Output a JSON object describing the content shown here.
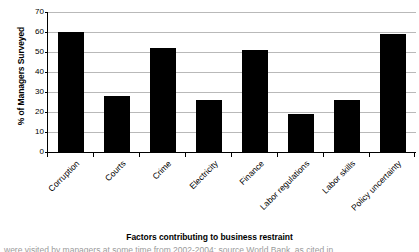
{
  "chart_data": {
    "type": "bar",
    "title": "",
    "xlabel": "Factors contributing to business restraint",
    "ylabel": "% of Managers Surveyed",
    "categories": [
      "Corruption",
      "Courts",
      "Crime",
      "Electricity",
      "Finance",
      "Labor regulations",
      "Labor skills",
      "Policy uncertainty"
    ],
    "values": [
      60,
      28,
      52,
      26,
      51,
      19,
      26,
      59
    ],
    "ylim": [
      0,
      70
    ],
    "yticks": [
      0,
      10,
      20,
      30,
      40,
      50,
      60,
      70
    ],
    "ytick_labels": [
      "0",
      "10",
      "20",
      "30",
      "40",
      "50",
      "60",
      "70"
    ],
    "grid": "horizontal",
    "legend": "none",
    "bar_color": "#000000",
    "gridline_color": "#b9b9b9",
    "axis_color": "#000000",
    "background": "#ffffff"
  },
  "caption": {
    "clipped_text": "were visited by managers at some time from 2002-2004; source World Bank, as cited in"
  }
}
